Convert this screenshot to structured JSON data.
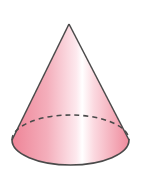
{
  "figure": {
    "shape": "cone",
    "colors": {
      "background": "#ffffff",
      "outline": "#4a4a4a",
      "fill_edge": "#ef8a9c",
      "fill_mid": "#f7c3cd",
      "fill_highlight": "#ffffff"
    },
    "geometry": {
      "apex": [
        69,
        24
      ],
      "base_center": [
        70.5,
        140
      ],
      "base_rx": 58.5,
      "base_ry": 25
    }
  }
}
